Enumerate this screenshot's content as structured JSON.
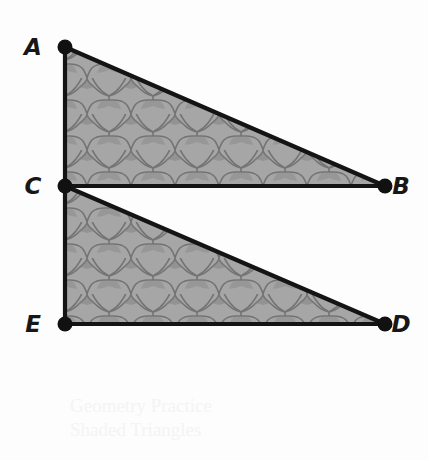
{
  "figure": {
    "background_color": "#fdfdfd",
    "stroke_color": "#141414",
    "shade_fill": "#a3a3a3",
    "shade_outline": "#6e6e6e",
    "axis_line_color": "#b7b7b7",
    "points": [
      {
        "id": "A",
        "label": "A",
        "x": 65,
        "y": 47,
        "label_x": 33,
        "label_y": 55
      },
      {
        "id": "B",
        "label": "B",
        "x": 385,
        "y": 186,
        "label_x": 396,
        "label_y": 194
      },
      {
        "id": "C",
        "label": "C",
        "x": 65,
        "y": 186,
        "label_x": 33,
        "label_y": 194
      },
      {
        "id": "D",
        "label": "D",
        "x": 385,
        "y": 324,
        "label_x": 396,
        "label_y": 332
      },
      {
        "id": "E",
        "label": "E",
        "x": 65,
        "y": 324,
        "label_x": 33,
        "label_y": 332
      }
    ],
    "triangles": [
      {
        "id": "upper",
        "vertices": "A,B,C",
        "path": "M65,47 L385,186 L65,186 Z"
      },
      {
        "id": "lower",
        "vertices": "C,D,E",
        "path": "M65,186 L385,324 L65,324 Z"
      }
    ],
    "segments": [
      {
        "id": "AB",
        "from": "A",
        "to": "B"
      },
      {
        "id": "AC",
        "from": "A",
        "to": "C"
      },
      {
        "id": "CB",
        "from": "C",
        "to": "B"
      },
      {
        "id": "CD",
        "from": "C",
        "to": "D"
      },
      {
        "id": "CE",
        "from": "C",
        "to": "E"
      },
      {
        "id": "ED",
        "from": "E",
        "to": "D"
      }
    ],
    "vertical_line": {
      "id": "AE-extended",
      "x": 65,
      "top_y": 8,
      "bottom_y": 392,
      "note": "light gray line fading above A and below E"
    },
    "watermark": {
      "line1": "Geometry Practice",
      "line2": "Shaded Triangles"
    }
  }
}
